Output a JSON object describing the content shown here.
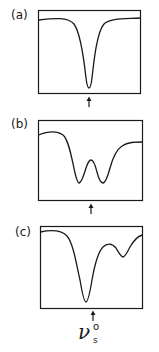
{
  "figure": {
    "line_color": "#1a1a1a",
    "background": "#ffffff"
  },
  "panels": [
    {
      "label": "(a)",
      "shape": "single sharp symmetric absorption dip centered at reference frequency"
    },
    {
      "label": "(b)",
      "shape": "two equal absorption dips symmetrically split around reference frequency"
    },
    {
      "label": "(c)",
      "shape": "strong dip near reference frequency plus weaker dip at higher frequency"
    }
  ],
  "marker": {
    "symbol": "ν",
    "subscript": "s",
    "superscript": "o",
    "arrow": "up-arrow"
  }
}
